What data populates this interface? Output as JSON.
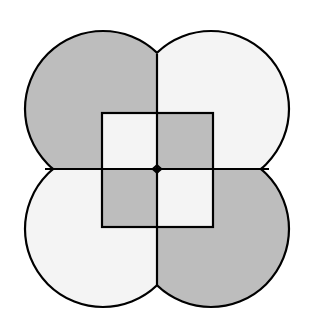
{
  "diagram": {
    "colors": {
      "shaded": "#bdbdbd",
      "light": "#f4f4f4",
      "stroke": "#000000",
      "background": "#ffffff"
    },
    "lobes": [
      {
        "position": "top-left",
        "shade": "shaded"
      },
      {
        "position": "top-right",
        "shade": "light"
      },
      {
        "position": "bottom-left",
        "shade": "light"
      },
      {
        "position": "bottom-right",
        "shade": "shaded"
      }
    ],
    "inner_square_cells": [
      {
        "position": "top-left",
        "shade": "light"
      },
      {
        "position": "top-right",
        "shade": "shaded"
      },
      {
        "position": "bottom-left",
        "shade": "shaded"
      },
      {
        "position": "bottom-right",
        "shade": "light"
      }
    ]
  }
}
